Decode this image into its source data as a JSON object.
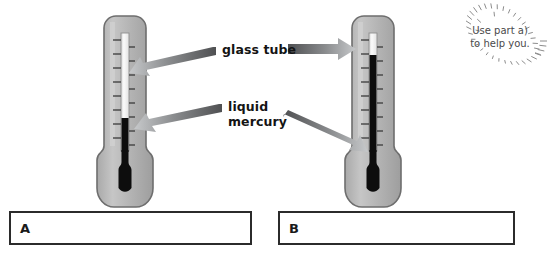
{
  "page": {
    "background_color": "#ffffff",
    "width": 552,
    "height": 268
  },
  "callouts": [
    {
      "id": "glass-tube",
      "text": "glass tube",
      "arrow_color_dark": "#58595b",
      "arrow_color_light": "#b9bbbd"
    },
    {
      "id": "liquid-mercury",
      "text": "liquid\nmercury",
      "line1": "liquid",
      "line2": "mercury",
      "arrow_color_dark": "#58595b",
      "arrow_color_light": "#b9bbbd"
    }
  ],
  "labels": {
    "glass_tube": "glass tube",
    "liquid_mercury": "liquid\nmercury"
  },
  "note": {
    "text": "Use part a)\nto help you.",
    "line1": "Use part a)",
    "line2": "to help you.",
    "ray_count": 40,
    "color": "#4a4a4a"
  },
  "thermometers": [
    {
      "id": "thermometer-a",
      "letter": "A",
      "mercury_level": "low",
      "mercury_color": "#0d0d0d",
      "glass_color": "#b4b4b4",
      "outline_color": "#6e6e6e",
      "capillary_color": "#f2f2f2",
      "tick_count": 17
    },
    {
      "id": "thermometer-b",
      "letter": "B",
      "mercury_level": "high",
      "mercury_color": "#0d0d0d",
      "glass_color": "#b4b4b4",
      "outline_color": "#6e6e6e",
      "capillary_color": "#f2f2f2",
      "tick_count": 17
    }
  ],
  "answer_boxes": [
    {
      "id": "answer-box-a",
      "letter": "A",
      "value": "",
      "placeholder": ""
    },
    {
      "id": "answer-box-b",
      "letter": "B",
      "value": "",
      "placeholder": ""
    }
  ],
  "colors": {
    "glass_fill": "#b4b4b4",
    "glass_fill_light": "#c9c9c9",
    "glass_outline": "#6e6e6e",
    "mercury": "#0d0d0d",
    "capillary": "#f4f4f4",
    "arrow_dark": "#58595b",
    "arrow_light": "#c2c4c6",
    "box_border": "#2b2b2b",
    "text": "#141414",
    "note_text": "#4a4a4a"
  }
}
